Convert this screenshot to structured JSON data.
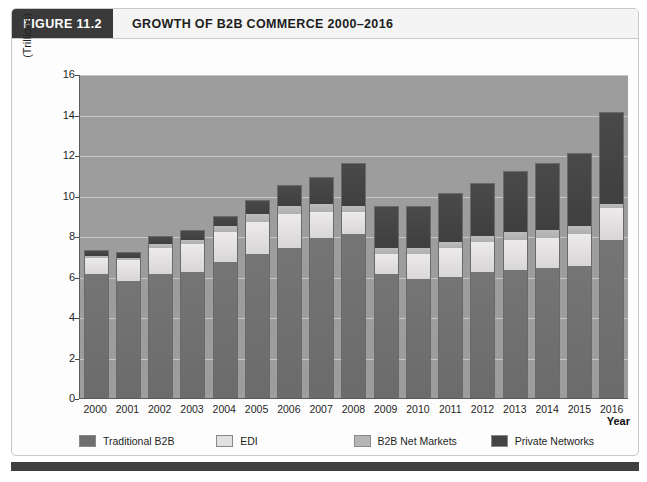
{
  "figure": {
    "tag": "FIGURE 11.2",
    "title": "GROWTH OF B2B COMMERCE 2000–2016"
  },
  "axis": {
    "ylabel": "(Trillions)",
    "xlabel": "Year"
  },
  "colors": {
    "traditional_b2b": "#6f6f6f",
    "edi": "#e2e0e0",
    "b2b_net_markets": "#b6b5b5",
    "private_networks": "#444444",
    "plot_background": "#9d9d9d",
    "tag_background": "#3a3a3a"
  },
  "chart_data": {
    "type": "bar",
    "title": "GROWTH OF B2B COMMERCE 2000–2016",
    "xlabel": "Year",
    "ylabel": "(Trillions)",
    "ylim": [
      0,
      16
    ],
    "yticks": [
      0,
      2,
      4,
      6,
      8,
      10,
      12,
      14,
      16
    ],
    "grid": true,
    "stacked": true,
    "legend_position": "bottom",
    "categories": [
      "2000",
      "2001",
      "2002",
      "2003",
      "2004",
      "2005",
      "2006",
      "2007",
      "2008",
      "2009",
      "2010",
      "2011",
      "2012",
      "2013",
      "2014",
      "2015",
      "2016"
    ],
    "series": [
      {
        "name": "Traditional B2B",
        "color": "#6f6f6f",
        "values": [
          6.1,
          5.8,
          6.1,
          6.2,
          6.7,
          7.1,
          7.4,
          7.9,
          8.1,
          6.1,
          5.9,
          6.0,
          6.2,
          6.3,
          6.4,
          6.5,
          7.8
        ]
      },
      {
        "name": "EDI",
        "color": "#e2e0e0",
        "values": [
          0.8,
          1.0,
          1.3,
          1.4,
          1.5,
          1.6,
          1.7,
          1.3,
          1.1,
          1.0,
          1.2,
          1.4,
          1.5,
          1.5,
          1.5,
          1.6,
          1.6
        ]
      },
      {
        "name": "B2B Net Markets",
        "color": "#b6b5b5",
        "values": [
          0.1,
          0.1,
          0.2,
          0.2,
          0.3,
          0.4,
          0.4,
          0.4,
          0.3,
          0.3,
          0.3,
          0.3,
          0.3,
          0.4,
          0.4,
          0.4,
          0.2
        ]
      },
      {
        "name": "Private Networks",
        "color": "#444444",
        "values": [
          0.3,
          0.3,
          0.4,
          0.5,
          0.5,
          0.7,
          1.0,
          1.3,
          2.1,
          2.1,
          2.1,
          2.4,
          2.6,
          3.0,
          3.3,
          3.6,
          4.5
        ]
      }
    ],
    "totals": [
      7.3,
      7.2,
      8.0,
      8.3,
      9.0,
      9.8,
      10.5,
      10.9,
      11.6,
      9.5,
      9.5,
      10.1,
      10.6,
      11.2,
      11.6,
      12.1,
      14.1
    ]
  },
  "legend": [
    {
      "label": "Traditional B2B",
      "swatch": "traditional_b2b"
    },
    {
      "label": "EDI",
      "swatch": "edi"
    },
    {
      "label": "B2B Net Markets",
      "swatch": "b2b_net_markets"
    },
    {
      "label": "Private Networks",
      "swatch": "private_networks"
    }
  ]
}
